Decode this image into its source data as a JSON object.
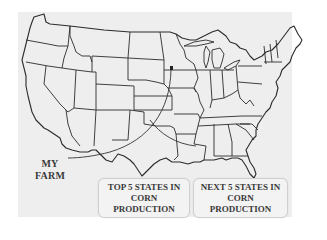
{
  "map": {
    "subject": "Contiguous United States state outline map",
    "background_color": "#eeeeee",
    "outline_color": "#2b2b2b",
    "marker": {
      "label_lines": [
        "MY",
        "FARM"
      ],
      "icon": "farm-marker-icon"
    }
  },
  "legend": {
    "items": [
      {
        "lines": [
          "TOP 5 STATES IN",
          "CORN",
          "PRODUCTION"
        ]
      },
      {
        "lines": [
          "NEXT 5 STATES IN",
          "CORN",
          "PRODUCTION"
        ]
      }
    ]
  }
}
